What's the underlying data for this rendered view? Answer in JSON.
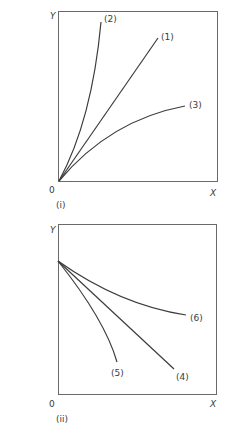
{
  "panels": [
    {
      "id": "i",
      "label": "(i)",
      "y_axis": "Y",
      "x_axis": "X",
      "origin": "0",
      "curves": [
        {
          "label": "(1)",
          "shape": "straight line from origin, rising"
        },
        {
          "label": "(2)",
          "shape": "convex rising curve from origin, steepest"
        },
        {
          "label": "(3)",
          "shape": "concave rising curve from origin, flattening"
        }
      ]
    },
    {
      "id": "ii",
      "label": "(ii)",
      "y_axis": "Y",
      "x_axis": "X",
      "origin": "0",
      "curves": [
        {
          "label": "(4)",
          "shape": "straight falling line from Y-intercept"
        },
        {
          "label": "(5)",
          "shape": "concave falling curve, steepening"
        },
        {
          "label": "(6)",
          "shape": "convex falling curve, flattening"
        }
      ]
    }
  ],
  "colors": {
    "line": "#3c3c3c",
    "frame": "#6a6a6a",
    "text": "#3a3a3a"
  }
}
